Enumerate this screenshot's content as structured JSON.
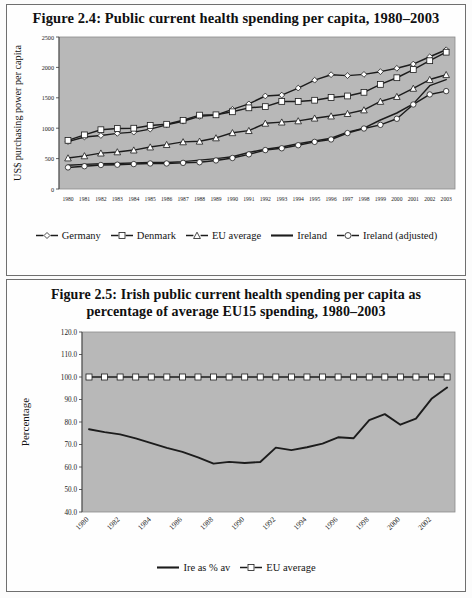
{
  "page": {
    "background": "#ffffff",
    "plot_background": "#b8b8b8",
    "line_color": "#1c1c1c",
    "marker_fill": "#ffffff"
  },
  "figure_24": {
    "title": "Figure 2.4: Public current health spending per capita, 1980–2003",
    "ylabel": "US$ purchasing power per capita",
    "legend": [
      {
        "label": "Germany",
        "symbol": "diamond"
      },
      {
        "label": "Denmark",
        "symbol": "square"
      },
      {
        "label": "EU average",
        "symbol": "triangle"
      },
      {
        "label": "Ireland",
        "symbol": "line"
      },
      {
        "label": "Ireland (adjusted)",
        "symbol": "circle"
      }
    ],
    "chart_data": {
      "type": "line",
      "title": "Figure 2.4: Public current health spending per capita, 1980–2003",
      "xlabel": "",
      "ylabel": "US$ purchasing power per capita",
      "ylim": [
        0,
        2500
      ],
      "yticks": [
        0,
        500,
        1000,
        1500,
        2000,
        2500
      ],
      "ytick_labels": [
        "0",
        "500",
        "1000",
        "1500",
        "2000",
        "2500"
      ],
      "grid": false,
      "legend_position": "bottom",
      "x": [
        1980,
        1981,
        1982,
        1983,
        1984,
        1985,
        1986,
        1987,
        1988,
        1989,
        1990,
        1991,
        1992,
        1993,
        1994,
        1995,
        1996,
        1997,
        1998,
        1999,
        2000,
        2001,
        2002,
        2003
      ],
      "xtick_labels": [
        "1980",
        "1981",
        "1982",
        "1983",
        "1984",
        "1985",
        "1986",
        "1987",
        "1988",
        "1989",
        "1990",
        "1991",
        "1992",
        "1993",
        "1994",
        "1995",
        "1996",
        "1997",
        "1998",
        "1999",
        "2000",
        "2001",
        "2002",
        "2003"
      ],
      "series": [
        {
          "name": "Germany",
          "marker": "diamond",
          "values": [
            780,
            855,
            880,
            915,
            935,
            985,
            1055,
            1115,
            1195,
            1215,
            1310,
            1400,
            1530,
            1545,
            1660,
            1790,
            1880,
            1865,
            1885,
            1930,
            1985,
            2055,
            2175,
            2290
          ]
        },
        {
          "name": "Denmark",
          "marker": "square",
          "values": [
            800,
            890,
            975,
            995,
            1000,
            1045,
            1065,
            1130,
            1215,
            1220,
            1270,
            1335,
            1355,
            1440,
            1440,
            1460,
            1505,
            1530,
            1590,
            1720,
            1830,
            1965,
            2110,
            2250
          ]
        },
        {
          "name": "EU average",
          "marker": "triangle",
          "values": [
            510,
            545,
            590,
            610,
            640,
            690,
            730,
            775,
            785,
            840,
            925,
            960,
            1080,
            1100,
            1120,
            1165,
            1200,
            1240,
            1300,
            1440,
            1520,
            1655,
            1800,
            1880
          ]
        },
        {
          "name": "Ireland",
          "marker": "line",
          "values": [
            390,
            405,
            415,
            420,
            430,
            435,
            435,
            450,
            475,
            500,
            530,
            600,
            655,
            690,
            745,
            790,
            835,
            935,
            1000,
            1135,
            1250,
            1400,
            1700,
            1800
          ]
        },
        {
          "name": "Ireland (adjusted)",
          "marker": "circle",
          "values": [
            355,
            375,
            395,
            400,
            410,
            420,
            420,
            430,
            440,
            470,
            510,
            570,
            640,
            670,
            720,
            775,
            815,
            920,
            995,
            1055,
            1155,
            1390,
            1555,
            1610
          ]
        }
      ]
    }
  },
  "figure_25": {
    "title_line1": "Figure 2.5: Irish public current health spending per capita as",
    "title_line2": "percentage of average EU15 spending, 1980–2003",
    "ylabel": "Percentage",
    "legend": [
      {
        "label": "Ire as % av",
        "symbol": "line"
      },
      {
        "label": "EU average",
        "symbol": "square"
      }
    ],
    "chart_data": {
      "type": "line",
      "title": "Figure 2.5: Irish public current health spending per capita as percentage of average EU15 spending, 1980–2003",
      "xlabel": "",
      "ylabel": "Percentage",
      "ylim": [
        40.0,
        120.0
      ],
      "yticks": [
        40.0,
        50.0,
        60.0,
        70.0,
        80.0,
        90.0,
        100.0,
        110.0,
        120.0
      ],
      "ytick_labels": [
        "40.0",
        "50.0",
        "60.0",
        "70.0",
        "80.0",
        "90.0",
        "100.0",
        "110.0",
        "120.0"
      ],
      "grid": false,
      "legend_position": "bottom",
      "x": [
        1980,
        1981,
        1982,
        1983,
        1984,
        1985,
        1986,
        1987,
        1988,
        1989,
        1990,
        1991,
        1992,
        1993,
        1994,
        1995,
        1996,
        1997,
        1998,
        1999,
        2000,
        2001,
        2002,
        2003
      ],
      "xtick_labels": [
        "1980",
        "1982",
        "1984",
        "1986",
        "1988",
        "1990",
        "1992",
        "1994",
        "1996",
        "1998",
        "2000",
        "2002"
      ],
      "xtick_rotation": 45,
      "series": [
        {
          "name": "Ire as % av",
          "marker": "line",
          "values": [
            76.8,
            75.5,
            74.5,
            72.7,
            70.6,
            68.5,
            66.7,
            64.3,
            61.5,
            62.3,
            61.8,
            62.2,
            68.6,
            67.5,
            68.8,
            70.4,
            73.2,
            72.8,
            80.8,
            83.5,
            78.8,
            81.5,
            90.3,
            95.3
          ]
        },
        {
          "name": "EU average",
          "marker": "square",
          "values": [
            100,
            100,
            100,
            100,
            100,
            100,
            100,
            100,
            100,
            100,
            100,
            100,
            100,
            100,
            100,
            100,
            100,
            100,
            100,
            100,
            100,
            100,
            100,
            100
          ]
        }
      ]
    }
  }
}
